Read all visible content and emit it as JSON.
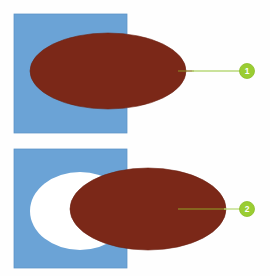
{
  "figure": {
    "width": 270,
    "height": 276,
    "background_color": "#fefefe"
  },
  "colors": {
    "blue_rectangle": "#6ba3d6",
    "blue_rectangle_edge": "#5c93c6",
    "brown_ellipse": "#7b2818",
    "brown_ellipse_edge": "#6d2213",
    "white_ellipse": "#ffffff",
    "callout_circle": "#9acd32",
    "callout_circle_edge": "#8cbd28",
    "callout_number_text": "#ffffff",
    "leader_line_outer": "#b9d97a",
    "leader_line_inner": "#8a7a22",
    "page_background": "#fefefe"
  },
  "panels": [
    {
      "id": "panel-1",
      "name": "upper-panel",
      "rectangle": {
        "name": "blue-rectangle",
        "x": 14,
        "y": 14,
        "width": 113,
        "height": 119,
        "color": "#6ba3d6"
      },
      "shapes": [
        {
          "name": "brown-ellipse",
          "type": "ellipse",
          "cx": 108,
          "cy": 71,
          "rx": 78,
          "ry": 38,
          "color": "#7b2818"
        }
      ],
      "white_ellipse": null,
      "callout": {
        "name": "callout-1",
        "label": "1",
        "circle": {
          "cx": 247,
          "cy": 71,
          "r": 7.5
        },
        "leader_line": {
          "x1": 178,
          "y1": 71,
          "x2": 239,
          "y2": 71,
          "inner_end_x": 194
        }
      }
    },
    {
      "id": "panel-2",
      "name": "lower-panel",
      "rectangle": {
        "name": "blue-rectangle",
        "x": 14,
        "y": 149,
        "width": 113,
        "height": 119,
        "color": "#6ba3d6"
      },
      "shapes": [
        {
          "name": "white-ellipse",
          "type": "ellipse",
          "cx": 80,
          "cy": 211,
          "rx": 50,
          "ry": 39,
          "color": "#ffffff"
        },
        {
          "name": "brown-ellipse",
          "type": "ellipse",
          "cx": 148,
          "cy": 209,
          "rx": 78,
          "ry": 41,
          "color": "#7b2818"
        }
      ],
      "callout": {
        "name": "callout-2",
        "label": "2",
        "circle": {
          "cx": 247,
          "cy": 209,
          "r": 7.5
        },
        "leader_line": {
          "x1": 178,
          "y1": 209,
          "x2": 239,
          "y2": 209,
          "inner_end_x": 226
        }
      }
    }
  ]
}
